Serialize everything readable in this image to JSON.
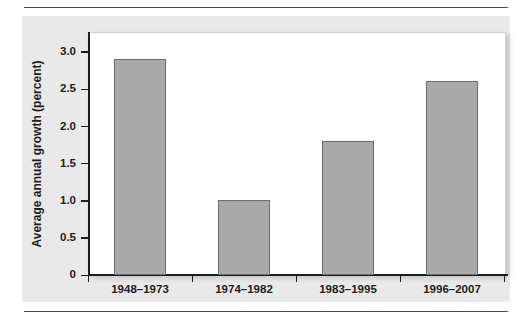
{
  "chart_data": {
    "type": "bar",
    "title": "",
    "xlabel": "",
    "ylabel": "Average annual growth (percent)",
    "categories": [
      "1948–1973",
      "1974–1982",
      "1983–1995",
      "1996–2007"
    ],
    "values": [
      2.9,
      1.0,
      1.8,
      2.6
    ],
    "ylim": [
      0,
      3.2
    ],
    "yticks": [
      0,
      0.5,
      1.0,
      1.5,
      2.0,
      2.5,
      3.0
    ],
    "ytick_labels": [
      "0",
      "0.5",
      "1.0",
      "1.5",
      "2.0",
      "2.5",
      "3.0"
    ],
    "grid": false,
    "legend": null,
    "bar_color": "#a9a9a9",
    "bar_border_color": "#6e6e6e",
    "axis_color": "#1c1c1c",
    "panel_color": "#e9e9e9",
    "plot_background": "#ffffff"
  }
}
